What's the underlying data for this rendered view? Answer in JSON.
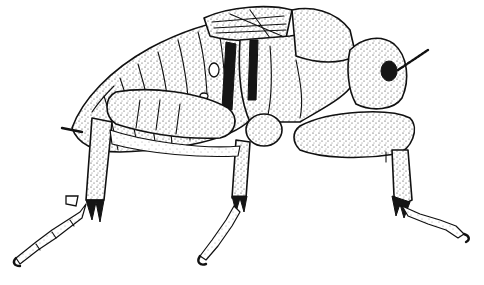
{
  "image": {
    "subject": "insect-nymph-illustration",
    "style": "black-and-white stipple pen drawing",
    "orientation": "side-profile-facing-right",
    "colors": {
      "background": "#ffffff",
      "ink": "#111111"
    }
  }
}
